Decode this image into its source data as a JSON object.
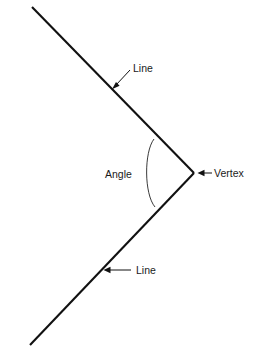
{
  "diagram": {
    "background_color": "#ffffff",
    "line_color": "#111111",
    "arc_color": "#3a3a3a",
    "text_color": "#1a1a1a",
    "labels": {
      "line_upper": "Line",
      "line_lower": "Line",
      "angle": "Angle",
      "vertex": "Vertex"
    },
    "geometry": {
      "vertex": [
        194,
        173
      ],
      "upper_ray_end": [
        32,
        7
      ],
      "lower_ray_end": [
        30,
        345
      ],
      "arc_start": [
        154,
        139
      ],
      "arc_end": [
        155,
        207
      ],
      "arc_leftmost_x": 145,
      "arc_radius": 49
    },
    "annotations": [
      {
        "name": "line-upper",
        "text": "Line",
        "text_x": 133,
        "text_y": 72,
        "leader_from": [
          130,
          70
        ],
        "leader_to": [
          113,
          88
        ],
        "arrow_direction": "down-left"
      },
      {
        "name": "angle",
        "text": "Angle",
        "text_x": 105,
        "text_y": 178,
        "leader": null
      },
      {
        "name": "line-lower",
        "text": "Line",
        "text_x": 136,
        "text_y": 274,
        "leader_from": [
          131,
          270
        ],
        "leader_to": [
          104,
          270
        ],
        "arrow_direction": "left"
      },
      {
        "name": "vertex",
        "text": "Vertex",
        "text_x": 214,
        "text_y": 177,
        "leader_from": [
          231,
          173
        ],
        "leader_to": [
          198,
          173
        ],
        "arrow_direction": "left"
      }
    ]
  }
}
